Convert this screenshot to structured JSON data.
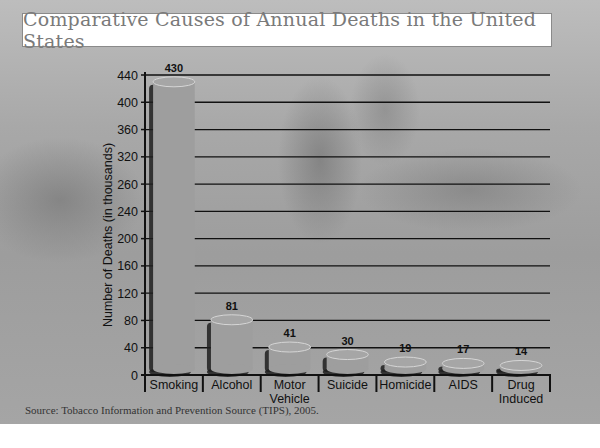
{
  "chart_data": {
    "type": "bar",
    "title": "Comparative Causes of Annual Deaths in the United States",
    "xlabel": "",
    "ylabel": "Number of Deaths (in thousands)",
    "categories": [
      "Smoking",
      "Alcohol",
      "Motor Vehicle",
      "Suicide",
      "Homicide",
      "AIDS",
      "Drug Induced"
    ],
    "category_lines": [
      [
        "Smoking"
      ],
      [
        "Alcohol"
      ],
      [
        "Motor",
        "Vehicle"
      ],
      [
        "Suicide"
      ],
      [
        "Homicide"
      ],
      [
        "AIDS"
      ],
      [
        "Drug",
        "Induced"
      ]
    ],
    "values": [
      430,
      81,
      41,
      30,
      19,
      17,
      14
    ],
    "data_labels": [
      "430",
      "81",
      "41",
      "30",
      "19",
      "17",
      "14"
    ],
    "ylim": [
      0,
      440
    ],
    "yticks": [
      0,
      40,
      80,
      120,
      160,
      200,
      240,
      280,
      320,
      360,
      400,
      440
    ],
    "ytick_labels": [
      "0",
      "40",
      "80",
      "120",
      "160",
      "200",
      "240",
      "260",
      "320",
      "360",
      "400",
      "440"
    ],
    "grid": true,
    "legend": "none",
    "bar_color": "#9e9e9e",
    "source": "Source: Tobacco Information and Prevention Source (TIPS), 2005."
  }
}
